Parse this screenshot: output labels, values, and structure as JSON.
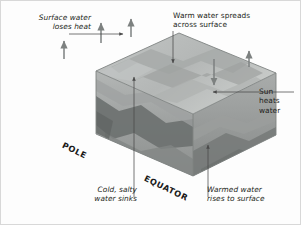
{
  "figure": {
    "background_color": "#fdfdfd",
    "text_color": "#231f20"
  },
  "annotations": [
    {
      "name": "surface-water-loses-heat",
      "text": "Surface water\nloses heat",
      "style": "italic",
      "align": "right",
      "leader": "horizontal line to up-arrow at top-left of block"
    },
    {
      "name": "warm-water-spreads-across-surface",
      "text": "Warm water spreads\nacross surface",
      "style": "regular",
      "align": "left",
      "leader": "vertical line down to down-arrow on top surface"
    },
    {
      "name": "sun-heats-water",
      "text": "Sun\nheats\nwater",
      "style": "regular",
      "align": "left",
      "leader": "horizontal line to left-arrow on top surface"
    },
    {
      "name": "cold-salty-water-sinks",
      "text": "Cold, salty\nwater sinks",
      "style": "italic",
      "align": "right",
      "leader": "vertical line up to up-arrow inside block at pole end"
    },
    {
      "name": "warmed-water-rises-to-surface",
      "text": "Warmed water\nrises to surface",
      "style": "italic",
      "align": "left",
      "leader": "vertical line up to up-arrow inside block at equator end"
    }
  ],
  "axis_labels": [
    {
      "name": "pole",
      "text": "POLE",
      "rotation_deg": 26
    },
    {
      "name": "equator",
      "text": "EQUATOR",
      "rotation_deg": 26
    }
  ],
  "block": {
    "description": "isometric translucent ocean block with layered grey water masses",
    "top_face_color": "#b9bcbb",
    "front_face_color": "#a8abaa",
    "side_face_color": "#919494",
    "deep_water_color": "#6f7271",
    "edge_color": "#8e9190"
  },
  "flow_arrows": [
    {
      "name": "heat-loss-arrow-1",
      "direction": "up",
      "location": "top-left outside block"
    },
    {
      "name": "heat-loss-arrow-2",
      "direction": "up",
      "location": "top-left outside block"
    },
    {
      "name": "heat-loss-arrow-3",
      "direction": "up",
      "location": "top-left edge of block"
    },
    {
      "name": "solar-input-arrow",
      "direction": "down",
      "location": "right side above block"
    },
    {
      "name": "sinking-arrow",
      "direction": "up",
      "location": "pole end, interior leader"
    },
    {
      "name": "upwelling-arrow",
      "direction": "up",
      "location": "equator end, interior leader"
    },
    {
      "name": "surface-spread-arrow",
      "direction": "down",
      "location": "top surface, pole-ward"
    }
  ]
}
